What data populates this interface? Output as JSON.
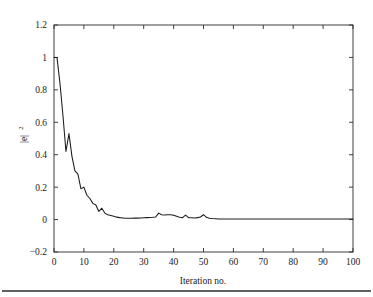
{
  "figure": {
    "background_color": "#ffffff",
    "line_color": "#1c1c1c",
    "axis_color": "#2b2b2b",
    "footer_rule": true
  },
  "chart_data": {
    "type": "line",
    "title": "",
    "subtitle": "",
    "xlabel": "Iteration no.",
    "ylabel": "|e|^2",
    "ylabel_base": "|e|",
    "ylabel_exponent": "2",
    "xlim": [
      0,
      100
    ],
    "ylim": [
      -0.2,
      1.2
    ],
    "xticks": [
      0,
      10,
      20,
      30,
      40,
      50,
      60,
      70,
      80,
      90,
      100
    ],
    "xtick_labels": [
      "0",
      "10",
      "20",
      "30",
      "40",
      "50",
      "60",
      "70",
      "80",
      "90",
      "100"
    ],
    "yticks": [
      -0.2,
      0,
      0.2,
      0.4,
      0.6,
      0.8,
      1,
      1.2
    ],
    "ytick_labels": [
      "-0.2",
      "0",
      "0.2",
      "0.4",
      "0.6",
      "0.8",
      "1",
      "1.2"
    ],
    "grid": false,
    "legend": null,
    "legend_position": "none",
    "annotations": [],
    "series": [
      {
        "name": "squared error",
        "x": [
          0,
          1,
          2,
          3,
          4,
          5,
          6,
          7,
          8,
          9,
          10,
          11,
          12,
          13,
          14,
          15,
          16,
          17,
          18,
          19,
          20,
          21,
          22,
          23,
          24,
          25,
          26,
          27,
          28,
          29,
          30,
          31,
          32,
          33,
          34,
          35,
          36,
          37,
          38,
          39,
          40,
          41,
          42,
          43,
          44,
          45,
          46,
          47,
          48,
          49,
          50,
          51,
          52,
          53,
          54,
          55,
          56,
          57,
          58,
          59,
          60,
          61,
          62,
          63,
          64,
          65,
          66,
          67,
          68,
          69,
          70,
          71,
          72,
          73,
          74,
          75,
          76,
          77,
          78,
          79,
          80,
          81,
          82,
          83,
          84,
          85,
          86,
          87,
          88,
          89,
          90,
          91,
          92,
          93,
          94,
          95,
          96,
          97,
          98,
          99,
          100
        ],
        "values": [
          1.0,
          1.0,
          0.84,
          0.64,
          0.42,
          0.53,
          0.39,
          0.3,
          0.28,
          0.19,
          0.2,
          0.15,
          0.13,
          0.1,
          0.09,
          0.05,
          0.07,
          0.04,
          0.03,
          0.025,
          0.02,
          0.015,
          0.012,
          0.01,
          0.008,
          0.008,
          0.008,
          0.009,
          0.009,
          0.01,
          0.011,
          0.012,
          0.013,
          0.014,
          0.016,
          0.04,
          0.03,
          0.028,
          0.03,
          0.03,
          0.026,
          0.02,
          0.014,
          0.012,
          0.028,
          0.012,
          0.011,
          0.01,
          0.012,
          0.016,
          0.03,
          0.014,
          0.008,
          0.006,
          0.005,
          0.004,
          0.004,
          0.003,
          0.003,
          0.003,
          0.003,
          0.003,
          0.003,
          0.003,
          0.003,
          0.003,
          0.003,
          0.003,
          0.003,
          0.003,
          0.003,
          0.003,
          0.003,
          0.003,
          0.003,
          0.003,
          0.003,
          0.003,
          0.003,
          0.003,
          0.003,
          0.003,
          0.003,
          0.003,
          0.003,
          0.003,
          0.003,
          0.003,
          0.003,
          0.003,
          0.003,
          0.003,
          0.003,
          0.003,
          0.003,
          0.003,
          0.003,
          0.003,
          0.003,
          0.003,
          0.003
        ]
      }
    ]
  }
}
